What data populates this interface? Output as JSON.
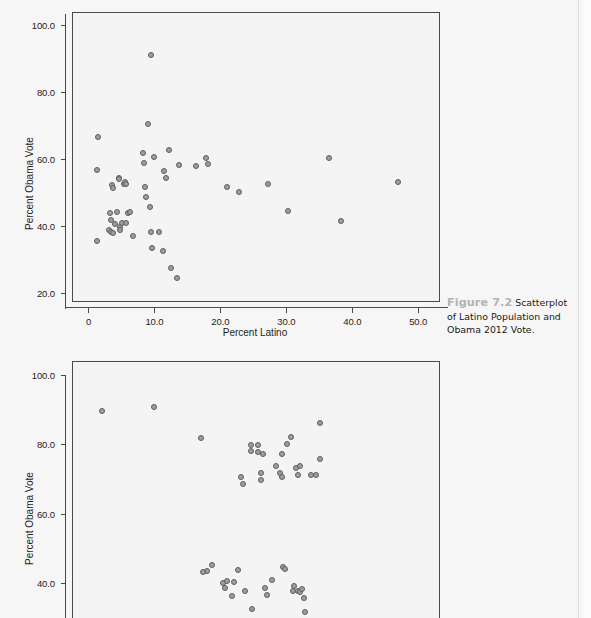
{
  "page": {
    "background_color": "#f6f6f6",
    "edge_color": "#e2e2e2"
  },
  "caption": {
    "number": "Figure 7.2",
    "text": "Scatterplot of Latino Population and Obama 2012 Vote."
  },
  "marker": {
    "fill_color": "#9d9d9d",
    "stroke_color": "#5e5e5e"
  },
  "chart_data": [
    {
      "id": "scatter-latino-obama-2012",
      "type": "scatter",
      "title": "",
      "xlabel": "Percent Latino",
      "ylabel": "Percent Obama Vote",
      "xlim": [
        -2.5,
        53.0
      ],
      "ylim": [
        18.0,
        104.0
      ],
      "xticks": [
        0,
        10,
        20,
        30,
        40,
        50
      ],
      "xtick_labels": [
        "0",
        "10.0",
        "20.0",
        "30.0",
        "40.0",
        "50.0"
      ],
      "yticks": [
        20,
        40,
        60,
        80,
        100
      ],
      "ytick_labels": [
        "20.0",
        "40.0",
        "60.0",
        "80.0",
        "100.0"
      ],
      "grid": false,
      "legend": null,
      "points": [
        [
          1.3,
          67.0
        ],
        [
          1.2,
          57.0
        ],
        [
          1.1,
          35.8
        ],
        [
          2.9,
          39.2
        ],
        [
          3.1,
          44.2
        ],
        [
          3.2,
          42.3
        ],
        [
          3.3,
          38.5
        ],
        [
          3.4,
          52.5
        ],
        [
          3.5,
          51.7
        ],
        [
          3.6,
          38.4
        ],
        [
          3.8,
          41.0
        ],
        [
          4.2,
          44.5
        ],
        [
          4.4,
          54.6
        ],
        [
          4.5,
          54.3
        ],
        [
          4.6,
          40.0
        ],
        [
          4.7,
          39.3
        ],
        [
          4.9,
          41.3
        ],
        [
          5.2,
          52.9
        ],
        [
          5.4,
          53.4
        ],
        [
          5.5,
          53.0
        ],
        [
          5.6,
          41.2
        ],
        [
          5.9,
          44.3
        ],
        [
          6.1,
          44.5
        ],
        [
          6.6,
          37.4
        ],
        [
          8.1,
          62.3
        ],
        [
          8.3,
          59.3
        ],
        [
          8.4,
          52.0
        ],
        [
          8.6,
          49.0
        ],
        [
          8.9,
          71.0
        ],
        [
          9.2,
          46.0
        ],
        [
          9.3,
          38.6
        ],
        [
          9.4,
          91.4
        ],
        [
          9.5,
          33.8
        ],
        [
          9.8,
          61.0
        ],
        [
          10.5,
          38.7
        ],
        [
          11.1,
          33.0
        ],
        [
          11.3,
          56.7
        ],
        [
          11.6,
          54.8
        ],
        [
          12.0,
          63.0
        ],
        [
          12.3,
          28.0
        ],
        [
          13.2,
          25.0
        ],
        [
          13.5,
          58.6
        ],
        [
          16.1,
          58.2
        ],
        [
          17.7,
          60.8
        ],
        [
          18.0,
          58.9
        ],
        [
          20.8,
          52.0
        ],
        [
          22.7,
          50.5
        ],
        [
          27.0,
          52.8
        ],
        [
          30.1,
          45.0
        ],
        [
          36.3,
          60.6
        ],
        [
          38.2,
          41.8
        ],
        [
          46.8,
          53.5
        ]
      ]
    },
    {
      "id": "scatter-second-partial",
      "type": "scatter",
      "title": "",
      "xlabel": "",
      "ylabel": "Percent Obama Vote",
      "xlim": [
        0.0,
        100.0
      ],
      "ylim": [
        30.0,
        104.0
      ],
      "yticks": [
        40,
        60,
        80,
        100
      ],
      "ytick_labels": [
        "40.0",
        "60.0",
        "80.0",
        "100.0"
      ],
      "grid": false,
      "legend": null,
      "points": [
        [
          8.0,
          90.0
        ],
        [
          22.0,
          91.0
        ],
        [
          35.0,
          82.0
        ],
        [
          38.0,
          45.5
        ],
        [
          36.5,
          43.8
        ],
        [
          41.0,
          40.5
        ],
        [
          44.0,
          40.7
        ],
        [
          45.0,
          44.0
        ],
        [
          47.0,
          38.0
        ],
        [
          46.0,
          71.0
        ],
        [
          46.5,
          69.0
        ],
        [
          48.5,
          80.0
        ],
        [
          48.5,
          78.5
        ],
        [
          50.5,
          80.0
        ],
        [
          50.5,
          78.0
        ],
        [
          49.0,
          33.0
        ],
        [
          52.0,
          77.5
        ],
        [
          51.5,
          72.0
        ],
        [
          51.5,
          70.0
        ],
        [
          52.5,
          39.0
        ],
        [
          53.0,
          37.0
        ],
        [
          54.5,
          41.2
        ],
        [
          55.5,
          74.0
        ],
        [
          57.0,
          77.5
        ],
        [
          56.5,
          72.0
        ],
        [
          57.5,
          45.0
        ],
        [
          58.0,
          44.5
        ],
        [
          57.0,
          71.0
        ],
        [
          58.5,
          80.5
        ],
        [
          59.5,
          82.5
        ],
        [
          60.0,
          38.0
        ],
        [
          60.5,
          39.5
        ],
        [
          61.5,
          38.0
        ],
        [
          62.0,
          37.8
        ],
        [
          62.5,
          38.5
        ],
        [
          61.0,
          73.5
        ],
        [
          62.0,
          74.0
        ],
        [
          61.5,
          71.5
        ],
        [
          63.0,
          36.0
        ],
        [
          63.5,
          32.0
        ],
        [
          64.0,
          28.5
        ],
        [
          65.0,
          71.5
        ],
        [
          66.5,
          71.5
        ],
        [
          67.5,
          86.5
        ],
        [
          67.5,
          76.0
        ],
        [
          41.5,
          39.0
        ],
        [
          43.5,
          36.5
        ],
        [
          42.0,
          41.0
        ],
        [
          35.5,
          43.5
        ]
      ]
    }
  ]
}
